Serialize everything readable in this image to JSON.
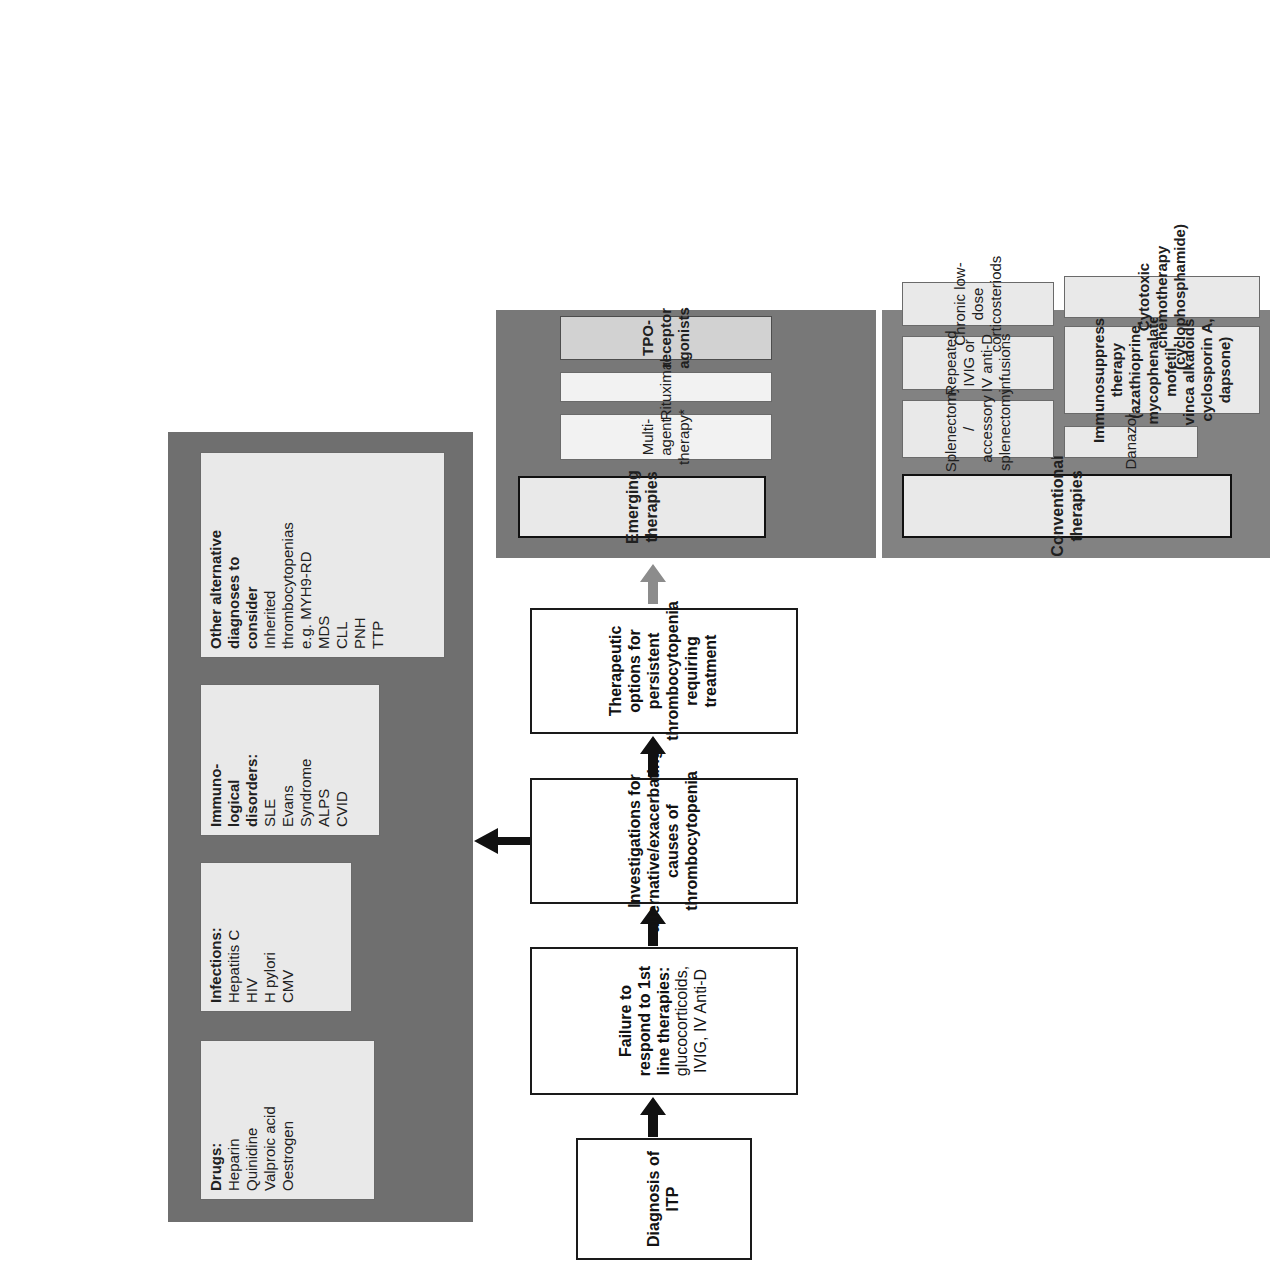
{
  "figure": {
    "colors": {
      "panel_dark": "#6f6f6f",
      "panel_emerging": "#787878",
      "card_light": "#e9e9e9",
      "card_dark": "#d2d2d2",
      "outline": "#1a1a1a",
      "arrow_black": "#111111",
      "arrow_grey": "#8c8c8c"
    }
  },
  "flow": {
    "steps": [
      {
        "id": "diagnosis",
        "label": "Diagnosis of ITP"
      },
      {
        "id": "failure",
        "label_bold": "Failure to respond to 1st line therapies:",
        "label_rest": " glucocorticoids, IVIG, IV Anti-D"
      },
      {
        "id": "investigations",
        "label": "Investigations for alternative/exacerbating causes of thrombocytopenia"
      },
      {
        "id": "therapeutic",
        "label": "Therapeutic options for persistent thrombocytopenia requiring treatment"
      }
    ],
    "arrows": [
      {
        "id": "arrow-diagnosis-to-failure",
        "style": "black"
      },
      {
        "id": "arrow-failure-to-investigations",
        "style": "black"
      },
      {
        "id": "arrow-investigations-to-causes",
        "style": "black-up"
      },
      {
        "id": "arrow-investigations-to-therapeutic",
        "style": "black"
      },
      {
        "id": "arrow-therapeutic-to-treatments",
        "style": "grey"
      }
    ]
  },
  "causes_panel": {
    "groups": [
      {
        "id": "drugs",
        "heading": "Drugs:",
        "items": [
          "Heparin",
          "Quinidine",
          "Valproic acid",
          "Oestrogen"
        ]
      },
      {
        "id": "infections",
        "heading": "Infections:",
        "items": [
          "Hepatitis C",
          "HIV",
          "H pylori",
          "CMV"
        ]
      },
      {
        "id": "immunological",
        "heading": "Immuno-\nlogical\ndisorders:",
        "heading_lines": [
          "Immuno-",
          "logical",
          "disorders:"
        ],
        "items": [
          "SLE",
          "Evans Syndrome",
          "ALPS",
          "CVID"
        ],
        "item_lines": [
          [
            "SLE"
          ],
          [
            "Evans",
            "Syndrome"
          ],
          [
            "ALPS"
          ],
          [
            "CVID"
          ]
        ]
      },
      {
        "id": "other-alternative",
        "heading_lines": [
          "Other alternative",
          "diagnoses to",
          "consider"
        ],
        "item_lines": [
          [
            "Inherited",
            "thrombocytopenias",
            "e.g. MYH9-RD"
          ],
          [
            "MDS"
          ],
          [
            "CLL"
          ],
          [
            "PNH"
          ],
          [
            "TTP"
          ]
        ]
      }
    ]
  },
  "treatments": {
    "conventional": {
      "title": "Conventional therapies",
      "items": [
        {
          "id": "splenectomy",
          "lines": [
            "Splenectomy /",
            "accessory",
            "splenectomy"
          ],
          "shade": "light"
        },
        {
          "id": "danazol",
          "lines": [
            "Danazol"
          ],
          "shade": "light"
        },
        {
          "id": "repeated-ivig",
          "lines": [
            "Repeated IVIG or",
            "IV anti-D",
            "infusions"
          ],
          "shade": "light"
        },
        {
          "id": "immunosuppressive",
          "lines": [
            "Immunosuppressive",
            "therapy (azathioprine,",
            "mycophenalate mofetil,",
            "vinca alkaloids,",
            "cyclosporin A, dapsone)"
          ],
          "shade": "light"
        },
        {
          "id": "chronic-low-dose",
          "lines": [
            "Chronic low-dose",
            "corticosteriods"
          ],
          "shade": "light"
        },
        {
          "id": "cytotoxic",
          "lines": [
            "Cytotoxic chemotherapy",
            "(cyclophosphamide)"
          ],
          "shade": "light"
        }
      ]
    },
    "emerging": {
      "title": "Emerging therapies",
      "items": [
        {
          "id": "multi-agent",
          "lines": [
            "Multi-agent",
            "therapy*"
          ],
          "shade": "bright"
        },
        {
          "id": "rituximab",
          "lines": [
            "Rituximab"
          ],
          "shade": "bright"
        },
        {
          "id": "tpo-receptor",
          "lines": [
            "TPO-receptor",
            "agonists"
          ],
          "shade": "dark"
        }
      ]
    }
  }
}
